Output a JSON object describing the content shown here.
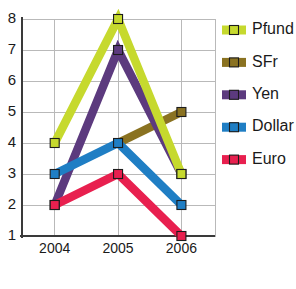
{
  "chart_data": {
    "type": "line",
    "title": "",
    "xlabel": "",
    "ylabel": "",
    "categories": [
      "2004",
      "2005",
      "2006"
    ],
    "x": [
      2004,
      2005,
      2006
    ],
    "ylim": [
      1,
      8
    ],
    "yticks": [
      1,
      2,
      3,
      4,
      5,
      6,
      7,
      8
    ],
    "ytick_labels": [
      "1",
      "2",
      "3",
      "4",
      "5",
      "6",
      "7",
      "8"
    ],
    "grid": true,
    "legend_position": "right",
    "series": [
      {
        "name": "Pfund",
        "color": "#c6d92e",
        "values": [
          4,
          8,
          3
        ],
        "marker": "square"
      },
      {
        "name": "SFr",
        "color": "#8a7221",
        "values": [
          null,
          4,
          5
        ],
        "marker": "square"
      },
      {
        "name": "Yen",
        "color": "#5c3a7e",
        "values": [
          2,
          7,
          3
        ],
        "marker": "square"
      },
      {
        "name": "Dollar",
        "color": "#1f7ec4",
        "values": [
          3,
          4,
          2
        ],
        "marker": "square"
      },
      {
        "name": "Euro",
        "color": "#e8204f",
        "values": [
          2,
          3,
          1
        ],
        "marker": "square"
      }
    ]
  },
  "legend": {
    "items": [
      {
        "label": "Pfund",
        "color": "#c6d92e"
      },
      {
        "label": "SFr",
        "color": "#8a7221"
      },
      {
        "label": "Yen",
        "color": "#5c3a7e"
      },
      {
        "label": "Dollar",
        "color": "#1f7ec4"
      },
      {
        "label": "Euro",
        "color": "#e8204f"
      }
    ]
  },
  "axes": {
    "y_tick_labels": [
      "8",
      "7",
      "6",
      "5",
      "4",
      "3",
      "2",
      "1"
    ],
    "x_tick_labels": [
      "2004",
      "2005",
      "2006"
    ]
  },
  "colors": {
    "grid": "#b9b9b9",
    "axis": "#3a3a3a",
    "text": "#1a1a1a",
    "background": "#ffffff",
    "marker_outline": "#1c1c1c"
  }
}
